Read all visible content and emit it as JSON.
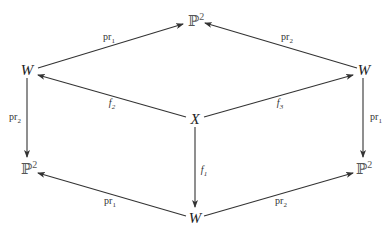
{
  "nodes": {
    "top": {
      "base": "ℙ",
      "sup": "2"
    },
    "left": {
      "text": "W"
    },
    "right": {
      "text": "W"
    },
    "center": {
      "text": "X"
    },
    "bottom_left": {
      "base": "ℙ",
      "sup": "2"
    },
    "bottom_right": {
      "base": "ℙ",
      "sup": "2"
    },
    "bottom": {
      "text": "W"
    }
  },
  "arrows": {
    "left_to_top": {
      "base": "pr",
      "sub": "1"
    },
    "right_to_top": {
      "base": "pr",
      "sub": "2"
    },
    "center_to_left": {
      "base": "f",
      "sub": "2"
    },
    "center_to_right": {
      "base": "f",
      "sub": "3"
    },
    "center_to_bottom": {
      "base": "f",
      "sub": "1"
    },
    "left_to_bottom_left": {
      "base": "pr",
      "sub": "2"
    },
    "right_to_bottom_right": {
      "base": "pr",
      "sub": "1"
    },
    "bottom_to_bottom_left": {
      "base": "pr",
      "sub": "1"
    },
    "bottom_to_bottom_right": {
      "base": "pr",
      "sub": "2"
    }
  }
}
